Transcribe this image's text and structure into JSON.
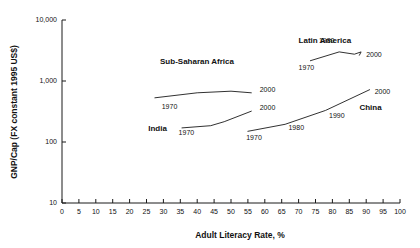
{
  "chart_data": {
    "type": "line",
    "title": "",
    "xlabel": "Adult Literacy Rate, %",
    "ylabel": "GNP/Cap (FX constant 1995 US$)",
    "xlim": [
      0,
      100
    ],
    "ylim": [
      10,
      10000
    ],
    "yscale": "log",
    "grid": false,
    "legend_position": "inline-annotations",
    "xticks": [
      "0",
      "5",
      "10",
      "15",
      "20",
      "25",
      "30",
      "35",
      "40",
      "45",
      "50",
      "55",
      "60",
      "65",
      "70",
      "75",
      "80",
      "85",
      "90",
      "95",
      "100"
    ],
    "yticks": [
      "10",
      "100",
      "1,000",
      "10,000"
    ],
    "ytick_values": [
      10,
      100,
      1000,
      10000
    ],
    "series": [
      {
        "name": "Sub-Saharan Africa",
        "label_position": {
          "x": 29,
          "y": 1900
        },
        "points": [
          {
            "x": 27.5,
            "y": 530,
            "year": "1970"
          },
          {
            "x": 40,
            "y": 640,
            "year": ""
          },
          {
            "x": 50,
            "y": 680,
            "year": ""
          },
          {
            "x": 56,
            "y": 640,
            "year": "2000"
          }
        ],
        "endpoint_labels": [
          {
            "text": "1970",
            "x": 29.5,
            "y": 350
          },
          {
            "text": "2000",
            "x": 58.5,
            "y": 670
          }
        ]
      },
      {
        "name": "India",
        "label_position": {
          "x": 25.5,
          "y": 150
        },
        "points": [
          {
            "x": 35.5,
            "y": 170,
            "year": "1970"
          },
          {
            "x": 44,
            "y": 185,
            "year": ""
          },
          {
            "x": 48,
            "y": 215,
            "year": ""
          },
          {
            "x": 56,
            "y": 320,
            "year": "2000"
          }
        ],
        "endpoint_labels": [
          {
            "text": "1970",
            "x": 34.5,
            "y": 128
          },
          {
            "text": "2000",
            "x": 58.5,
            "y": 330
          }
        ]
      },
      {
        "name": "Latin America",
        "label_position": {
          "x": 70,
          "y": 4200
        },
        "points": [
          {
            "x": 73.5,
            "y": 2150,
            "year": "1970"
          },
          {
            "x": 82,
            "y": 3000,
            "year": "1980"
          },
          {
            "x": 86.5,
            "y": 2750,
            "year": ""
          },
          {
            "x": 88.5,
            "y": 3000,
            "year": ""
          },
          {
            "x": 88,
            "y": 2650,
            "year": "2000"
          }
        ],
        "endpoint_labels": [
          {
            "text": "1970",
            "x": 70,
            "y": 1500
          },
          {
            "text": "1980",
            "x": 76,
            "y": 4200
          },
          {
            "text": "2000",
            "x": 90,
            "y": 2450
          }
        ]
      },
      {
        "name": "China",
        "label_position": {
          "x": 88,
          "y": 330
        },
        "points": [
          {
            "x": 55,
            "y": 150,
            "year": "1970"
          },
          {
            "x": 66,
            "y": 195,
            "year": "1980"
          },
          {
            "x": 78,
            "y": 330,
            "year": "1990"
          },
          {
            "x": 91,
            "y": 720,
            "year": "2000"
          }
        ],
        "endpoint_labels": [
          {
            "text": "1970",
            "x": 54.5,
            "y": 108
          },
          {
            "text": "1980",
            "x": 67,
            "y": 155
          },
          {
            "text": "1990",
            "x": 79,
            "y": 250
          },
          {
            "text": "2000",
            "x": 92.5,
            "y": 620
          }
        ]
      }
    ]
  },
  "colors": {
    "line": "#1a1a1a",
    "axis": "#1a1a1a",
    "text": "#111111",
    "background": "#ffffff"
  }
}
